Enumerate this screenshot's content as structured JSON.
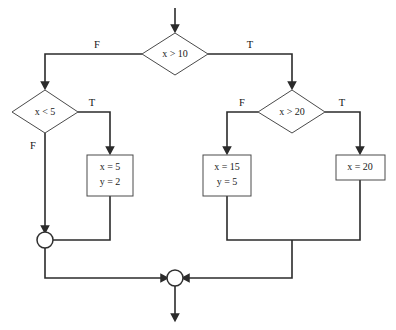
{
  "diagram": {
    "type": "flowchart",
    "background_color": "#ffffff",
    "shape_stroke_color": "#4a4a4a",
    "connector_color": "#2b2b2b"
  },
  "nodes": {
    "decision_top": {
      "label": "x > 10",
      "var": "x",
      "op": ">",
      "value": "10"
    },
    "decision_left": {
      "label": "x < 5",
      "var": "x",
      "op": "<",
      "value": "5"
    },
    "decision_right": {
      "label": "x > 20",
      "var": "x",
      "op": ">",
      "value": "20"
    },
    "process_left": {
      "line1": "x = 5",
      "line2": "y = 2"
    },
    "process_mid": {
      "line1": "x = 15",
      "line2": "y = 5"
    },
    "process_right": {
      "line1": "x = 20"
    }
  },
  "edge_labels": {
    "top_false": "F",
    "top_true": "T",
    "left_true": "T",
    "left_false": "F",
    "right_false": "F",
    "right_true": "T"
  }
}
